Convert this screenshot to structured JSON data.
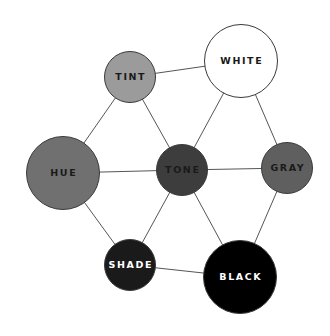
{
  "diagram": {
    "width": 330,
    "height": 336,
    "background": "#ffffff",
    "edge_color": "#555555",
    "nodes": [
      {
        "id": "tint",
        "label": "TINT",
        "cx": 130,
        "cy": 77,
        "r": 26,
        "fill": "#9b9b9b",
        "text_color": "#1a1a1a"
      },
      {
        "id": "white",
        "label": "WHITE",
        "cx": 241,
        "cy": 61,
        "r": 37,
        "fill": "#ffffff",
        "text_color": "#1a1a1a"
      },
      {
        "id": "hue",
        "label": "HUE",
        "cx": 63,
        "cy": 173,
        "r": 37,
        "fill": "#707070",
        "text_color": "#1a1a1a"
      },
      {
        "id": "tone",
        "label": "TONE",
        "cx": 182,
        "cy": 170,
        "r": 26,
        "fill": "#3d3d3d",
        "text_color": "#1a1a1a"
      },
      {
        "id": "gray",
        "label": "GRAY",
        "cx": 287,
        "cy": 168,
        "r": 26,
        "fill": "#5f5f5f",
        "text_color": "#1a1a1a"
      },
      {
        "id": "shade",
        "label": "SHADE",
        "cx": 130,
        "cy": 265,
        "r": 26,
        "fill": "#1a1a1a",
        "text_color": "#ffffff"
      },
      {
        "id": "black",
        "label": "BLACK",
        "cx": 240,
        "cy": 277,
        "r": 37,
        "fill": "#000000",
        "text_color": "#ffffff"
      }
    ],
    "edges": [
      {
        "from": "tint",
        "to": "white"
      },
      {
        "from": "tint",
        "to": "hue"
      },
      {
        "from": "tint",
        "to": "tone"
      },
      {
        "from": "white",
        "to": "tone"
      },
      {
        "from": "white",
        "to": "gray"
      },
      {
        "from": "hue",
        "to": "tone"
      },
      {
        "from": "tone",
        "to": "gray"
      },
      {
        "from": "hue",
        "to": "shade"
      },
      {
        "from": "tone",
        "to": "shade"
      },
      {
        "from": "tone",
        "to": "black"
      },
      {
        "from": "gray",
        "to": "black"
      },
      {
        "from": "shade",
        "to": "black"
      }
    ]
  },
  "labels": {
    "tint": "TINT",
    "white": "WHITE",
    "hue": "HUE",
    "tone": "TONE",
    "gray": "GRAY",
    "shade": "SHADE",
    "black": "BLACK"
  }
}
